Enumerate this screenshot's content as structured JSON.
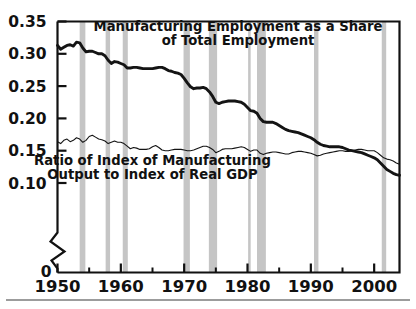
{
  "figure": {
    "background_color": "#ffffff",
    "line_color": "#141414",
    "band_color": "#c5c5c5",
    "axis_color": "#111111"
  },
  "chart_data": {
    "type": "line",
    "title": "",
    "xlabel": "",
    "ylabel": "",
    "xlim": [
      1950,
      2004
    ],
    "ylim": [
      0.085,
      0.35
    ],
    "grid": false,
    "legend_position": "inline-annotations",
    "y_ticks": [
      0.35,
      0.3,
      0.25,
      0.2,
      0.15,
      0.1
    ],
    "y_tick_labels": [
      "0.35",
      "0.30",
      "0.25",
      "0.20",
      "0.15",
      "0.10"
    ],
    "y_axis_break": true,
    "y_axis_origin_label": "0",
    "x_ticks_major": [
      1950,
      1960,
      1970,
      1980,
      1990,
      2000
    ],
    "x_tick_labels": [
      "1950",
      "1960",
      "1970",
      "1980",
      "1990",
      "2000"
    ],
    "x_ticks_minor": [
      1955,
      1965,
      1975,
      1985,
      1995
    ],
    "annotations": [
      {
        "name": "manufacturing-employment-label",
        "line1": "Manufacturing Employment as a Share",
        "line2": "of Total Employment",
        "x": 1978.5,
        "y": 0.335
      },
      {
        "name": "ratio-output-gdp-label",
        "line1": "Ratio of Index of Manufacturing",
        "line2": "Output to Index of Real GDP",
        "x": 1965.0,
        "y": 0.128
      }
    ],
    "recession_bands": [
      {
        "label": "1953-1954",
        "start": 1953.5,
        "end": 1954.4
      },
      {
        "label": "1957-1958",
        "start": 1957.6,
        "end": 1958.3
      },
      {
        "label": "1960-1961",
        "start": 1960.3,
        "end": 1961.1
      },
      {
        "label": "1969-1970",
        "start": 1969.9,
        "end": 1970.9
      },
      {
        "label": "1973-1975",
        "start": 1973.9,
        "end": 1975.2
      },
      {
        "label": "1980",
        "start": 1980.1,
        "end": 1980.5
      },
      {
        "label": "1981-1982",
        "start": 1981.5,
        "end": 1982.9
      },
      {
        "label": "1990-1991",
        "start": 1990.5,
        "end": 1991.2
      },
      {
        "label": "2001",
        "start": 2001.2,
        "end": 2001.9
      }
    ],
    "series": [
      {
        "name": "Manufacturing Employment as a Share of Total Employment",
        "style": "thick",
        "x": [
          1950.0,
          1950.5,
          1951.0,
          1951.5,
          1952.0,
          1952.5,
          1953.0,
          1953.5,
          1954.0,
          1954.5,
          1955.0,
          1955.5,
          1956.0,
          1956.5,
          1957.0,
          1957.5,
          1958.0,
          1958.5,
          1959.0,
          1959.5,
          1960.0,
          1960.5,
          1961.0,
          1961.5,
          1962.0,
          1962.5,
          1963.0,
          1963.5,
          1964.0,
          1964.5,
          1965.0,
          1965.5,
          1966.0,
          1966.5,
          1967.0,
          1967.5,
          1968.0,
          1968.5,
          1969.0,
          1969.5,
          1970.0,
          1970.5,
          1971.0,
          1971.5,
          1972.0,
          1972.5,
          1973.0,
          1973.5,
          1974.0,
          1974.5,
          1975.0,
          1975.5,
          1976.0,
          1976.5,
          1977.0,
          1977.5,
          1978.0,
          1978.5,
          1979.0,
          1979.5,
          1980.0,
          1980.5,
          1981.0,
          1981.5,
          1982.0,
          1982.5,
          1983.0,
          1983.5,
          1984.0,
          1984.5,
          1985.0,
          1985.5,
          1986.0,
          1986.5,
          1987.0,
          1987.5,
          1988.0,
          1988.5,
          1989.0,
          1989.5,
          1990.0,
          1990.5,
          1991.0,
          1991.5,
          1992.0,
          1992.5,
          1993.0,
          1993.5,
          1994.0,
          1994.5,
          1995.0,
          1995.5,
          1996.0,
          1996.5,
          1997.0,
          1997.5,
          1998.0,
          1998.5,
          1999.0,
          1999.5,
          2000.0,
          2000.5,
          2001.0,
          2001.5,
          2002.0,
          2002.5,
          2003.0,
          2003.5,
          2004.0
        ],
        "y": [
          0.313,
          0.307,
          0.31,
          0.313,
          0.314,
          0.312,
          0.318,
          0.317,
          0.309,
          0.303,
          0.304,
          0.304,
          0.302,
          0.3,
          0.3,
          0.297,
          0.29,
          0.285,
          0.288,
          0.287,
          0.285,
          0.283,
          0.278,
          0.278,
          0.279,
          0.279,
          0.278,
          0.277,
          0.277,
          0.277,
          0.277,
          0.278,
          0.279,
          0.279,
          0.277,
          0.274,
          0.273,
          0.271,
          0.27,
          0.268,
          0.262,
          0.255,
          0.249,
          0.246,
          0.247,
          0.247,
          0.248,
          0.246,
          0.241,
          0.234,
          0.225,
          0.223,
          0.225,
          0.226,
          0.227,
          0.227,
          0.227,
          0.226,
          0.225,
          0.222,
          0.217,
          0.212,
          0.211,
          0.208,
          0.2,
          0.195,
          0.194,
          0.194,
          0.194,
          0.192,
          0.189,
          0.186,
          0.183,
          0.181,
          0.18,
          0.179,
          0.178,
          0.176,
          0.174,
          0.172,
          0.17,
          0.167,
          0.163,
          0.16,
          0.158,
          0.157,
          0.156,
          0.156,
          0.156,
          0.156,
          0.155,
          0.153,
          0.151,
          0.15,
          0.149,
          0.148,
          0.147,
          0.145,
          0.143,
          0.141,
          0.139,
          0.136,
          0.131,
          0.126,
          0.121,
          0.118,
          0.115,
          0.113,
          0.112
        ]
      },
      {
        "name": "Ratio of Index of Manufacturing Output to Index of Real GDP",
        "style": "thin",
        "x": [
          1950.0,
          1950.5,
          1951.0,
          1951.5,
          1952.0,
          1952.5,
          1953.0,
          1953.5,
          1954.0,
          1954.5,
          1955.0,
          1955.5,
          1956.0,
          1956.5,
          1957.0,
          1957.5,
          1958.0,
          1958.5,
          1959.0,
          1959.5,
          1960.0,
          1960.5,
          1961.0,
          1961.5,
          1962.0,
          1962.5,
          1963.0,
          1963.5,
          1964.0,
          1964.5,
          1965.0,
          1965.5,
          1966.0,
          1966.5,
          1967.0,
          1967.5,
          1968.0,
          1968.5,
          1969.0,
          1969.5,
          1970.0,
          1970.5,
          1971.0,
          1971.5,
          1972.0,
          1972.5,
          1973.0,
          1973.5,
          1974.0,
          1974.5,
          1975.0,
          1975.5,
          1976.0,
          1976.5,
          1977.0,
          1977.5,
          1978.0,
          1978.5,
          1979.0,
          1979.5,
          1980.0,
          1980.5,
          1981.0,
          1981.5,
          1982.0,
          1982.5,
          1983.0,
          1983.5,
          1984.0,
          1984.5,
          1985.0,
          1985.5,
          1986.0,
          1986.5,
          1987.0,
          1987.5,
          1988.0,
          1988.5,
          1989.0,
          1989.5,
          1990.0,
          1990.5,
          1991.0,
          1991.5,
          1992.0,
          1992.5,
          1993.0,
          1993.5,
          1994.0,
          1994.5,
          1995.0,
          1995.5,
          1996.0,
          1996.5,
          1997.0,
          1997.5,
          1998.0,
          1998.5,
          1999.0,
          1999.5,
          2000.0,
          2000.5,
          2001.0,
          2001.5,
          2002.0,
          2002.5,
          2003.0,
          2003.5,
          2004.0
        ],
        "y": [
          0.164,
          0.161,
          0.166,
          0.168,
          0.164,
          0.166,
          0.17,
          0.168,
          0.163,
          0.166,
          0.172,
          0.174,
          0.171,
          0.168,
          0.167,
          0.165,
          0.161,
          0.163,
          0.165,
          0.163,
          0.163,
          0.161,
          0.157,
          0.153,
          0.155,
          0.154,
          0.152,
          0.152,
          0.152,
          0.153,
          0.156,
          0.158,
          0.155,
          0.151,
          0.15,
          0.15,
          0.151,
          0.152,
          0.152,
          0.152,
          0.151,
          0.15,
          0.15,
          0.151,
          0.153,
          0.155,
          0.157,
          0.157,
          0.155,
          0.152,
          0.147,
          0.149,
          0.152,
          0.153,
          0.153,
          0.153,
          0.154,
          0.155,
          0.156,
          0.155,
          0.152,
          0.149,
          0.151,
          0.151,
          0.146,
          0.144,
          0.146,
          0.147,
          0.148,
          0.148,
          0.147,
          0.146,
          0.145,
          0.145,
          0.147,
          0.148,
          0.149,
          0.149,
          0.148,
          0.147,
          0.146,
          0.144,
          0.142,
          0.143,
          0.145,
          0.146,
          0.147,
          0.148,
          0.149,
          0.15,
          0.15,
          0.149,
          0.149,
          0.15,
          0.151,
          0.152,
          0.152,
          0.151,
          0.15,
          0.15,
          0.15,
          0.147,
          0.143,
          0.139,
          0.137,
          0.136,
          0.134,
          0.131,
          0.129
        ]
      }
    ]
  }
}
